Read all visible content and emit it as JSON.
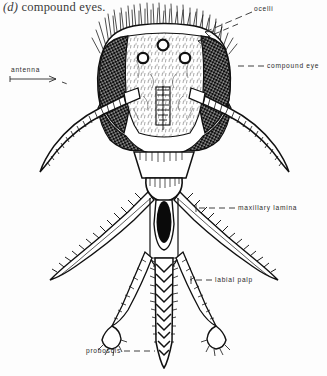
{
  "figure": {
    "caption_prefix": "(d)",
    "caption_text": "compound eyes.",
    "background_color": "#fdfdfd",
    "ink_color": "#111111"
  },
  "labels": {
    "ocelli": "ocelli",
    "antenna": "antenna",
    "compound_eye": "compound eye",
    "maxillary_lamina": "maxillary lamina",
    "labial_palp": "labial palp",
    "proboscis": "proboscis"
  },
  "anatomy_parts": [
    {
      "name": "ocelli",
      "count": 3,
      "location": "top of frons",
      "label_side": "right"
    },
    {
      "name": "antenna",
      "count": 2,
      "location": "lateral, curving down-outward",
      "label_side": "left"
    },
    {
      "name": "compound eye",
      "count": 2,
      "location": "lateral head, dark stippled",
      "label_side": "right"
    },
    {
      "name": "maxillary lamina",
      "count": 2,
      "location": "diagonal below head",
      "label_side": "right"
    },
    {
      "name": "labial palp",
      "count": 2,
      "location": "flanking proboscis",
      "label_side": "right"
    },
    {
      "name": "proboscis",
      "count": 1,
      "location": "central, ventral",
      "label_side": "left"
    }
  ]
}
